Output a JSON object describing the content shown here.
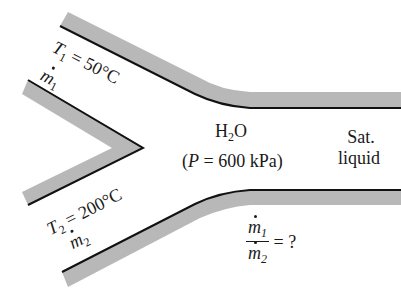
{
  "diagram": {
    "type": "mixing chamber",
    "inlet1": {
      "temperature_symbol": "T",
      "subscript": "1",
      "temperature_text": "= 50°C",
      "massflow_symbol": "m",
      "massflow_subscript": "1"
    },
    "inlet2": {
      "temperature_symbol": "T",
      "subscript": "2",
      "temperature_text": "= 200°C",
      "massflow_symbol": "m",
      "massflow_subscript": "2"
    },
    "chamber": {
      "fluid_main": "H",
      "fluid_sub": "2",
      "fluid_end": "O",
      "pressure_open": "(",
      "pressure_symbol": "P",
      "pressure_text": " = 600 kPa)"
    },
    "outlet": {
      "line1": "Sat.",
      "line2": "liquid"
    },
    "question": {
      "num_symbol": "m",
      "num_sub": "1",
      "den_symbol": "m",
      "den_sub": "2",
      "rhs": "= ?"
    },
    "colors": {
      "wall_fill": "#b8b8b8",
      "wall_line": "#111111",
      "background": "#ffffff"
    }
  }
}
